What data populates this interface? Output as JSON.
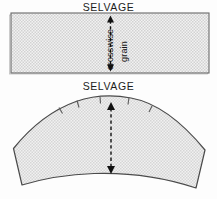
{
  "figure": {
    "background_color": "#fdfdfd"
  },
  "labels": {
    "selvage_top": "SELVAGE",
    "selvage_bottom": "SELVAGE",
    "grain_line_1": "crosswise",
    "grain_line_2": "grain"
  },
  "colors": {
    "fill_gray": "#e3e3e3",
    "outline": "#565656",
    "pattern_outline": "#4a4a4a",
    "arrow": "#111111",
    "text": "#1c1c1c",
    "dot_pattern": "#c9c9c9"
  },
  "fabric_rectangle": {
    "name": "fabric-swatch",
    "x": 11,
    "y": 13,
    "width": 198,
    "height": 60,
    "fill": "#e3e3e3",
    "stroke": "#565656"
  },
  "grain_arrow_top": {
    "name": "crosswise-grain-arrow",
    "x": 110,
    "y_start": 17,
    "y_end": 70,
    "style": "dashed double-headed vertical"
  },
  "pattern_piece": {
    "name": "curved-pattern-piece",
    "fill": "#e3e3e3",
    "stroke": "#4a4a4a",
    "notch_count": 4,
    "description": "sleeve cap style curved pattern piece"
  },
  "grain_arrow_bottom": {
    "name": "pattern-grainline-arrow",
    "x": 111,
    "y_start": 103,
    "y_end": 173,
    "style": "dashed double-headed vertical"
  }
}
